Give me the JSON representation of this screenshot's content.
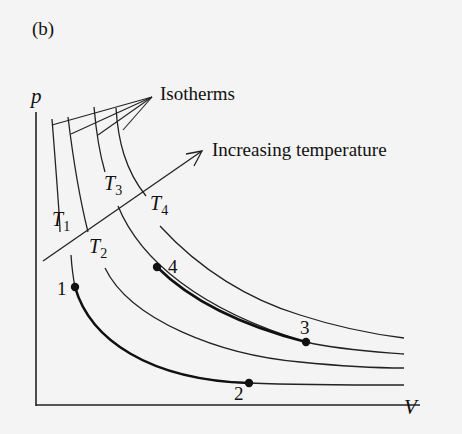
{
  "figure": {
    "panel_label": "(b)",
    "y_axis_label": "p",
    "x_axis_label": "V",
    "annotations": {
      "isotherms": "Isotherms",
      "increasing_temperature": "Increasing temperature"
    },
    "isotherms": [
      {
        "label": "T",
        "sub": "1"
      },
      {
        "label": "T",
        "sub": "2"
      },
      {
        "label": "T",
        "sub": "3"
      },
      {
        "label": "T",
        "sub": "4"
      }
    ],
    "points": [
      {
        "label": "1"
      },
      {
        "label": "2"
      },
      {
        "label": "3"
      },
      {
        "label": "4"
      }
    ],
    "colors": {
      "ink": "#111111",
      "background": "#f4f4f4"
    }
  }
}
